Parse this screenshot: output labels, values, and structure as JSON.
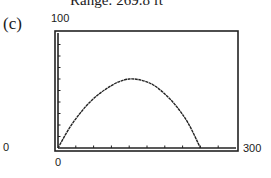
{
  "caption": "Range: 269.8 ft",
  "part_label": "(c)",
  "chart_data": {
    "type": "line",
    "title": "",
    "xlabel": "",
    "ylabel": "",
    "xlim": [
      0,
      300
    ],
    "ylim": [
      0,
      100
    ],
    "x_tick_labels": [
      "0",
      "300"
    ],
    "y_tick_labels": [
      "0",
      "100"
    ],
    "x_ticks_count": 10,
    "y_ticks_count": 10,
    "grid": false,
    "legend": false,
    "series": [
      {
        "name": "projectile path",
        "x": [
          0,
          20,
          40,
          60,
          80,
          100,
          120,
          140,
          160,
          180,
          200,
          220,
          240
        ],
        "y": [
          0,
          18,
          32,
          43,
          51,
          57,
          60,
          59,
          55,
          47,
          36,
          21,
          0
        ]
      }
    ]
  },
  "labels": {
    "y_max": "100",
    "y_min": "0",
    "x_min": "0",
    "x_max": "300"
  }
}
